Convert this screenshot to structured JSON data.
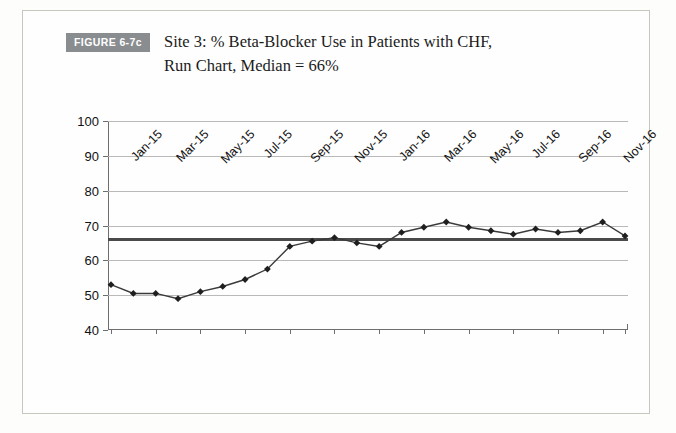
{
  "figure": {
    "badge_label": "FIGURE 6-7c",
    "caption": "Site 3: % Beta-Blocker Use in Patients with CHF,\nRun Chart, Median = 66%"
  },
  "chart_data": {
    "type": "line",
    "title": "Site 3: % Beta-Blocker Use in Patients with CHF, Run Chart, Median = 66%",
    "xlabel": "",
    "ylabel": "",
    "ylim": [
      40,
      100
    ],
    "ytick_labels": [
      "100",
      "90",
      "80",
      "70",
      "60",
      "50",
      "40"
    ],
    "ytick_values": [
      100,
      90,
      80,
      70,
      60,
      50,
      40
    ],
    "grid": true,
    "legend": "none",
    "median": 66,
    "median_label": "Median = 66%",
    "x": [
      "Jan-15",
      "Feb-15",
      "Mar-15",
      "Apr-15",
      "May-15",
      "Jun-15",
      "Jul-15",
      "Aug-15",
      "Sep-15",
      "Oct-15",
      "Nov-15",
      "Dec-15",
      "Jan-16",
      "Feb-16",
      "Mar-16",
      "Apr-16",
      "May-16",
      "Jun-16",
      "Jul-16",
      "Aug-16",
      "Sep-16",
      "Oct-16",
      "Nov-16",
      "Dec-16"
    ],
    "xtick_labels": [
      "Jan-15",
      "Mar-15",
      "May-15",
      "Jul-15",
      "Sep-15",
      "Nov-15",
      "Jan-16",
      "Mar-16",
      "May-16",
      "Jul-16",
      "Sep-16",
      "Nov-16"
    ],
    "series": [
      {
        "name": "% Beta-Blocker Use",
        "values": [
          53,
          50.5,
          50.5,
          49,
          51,
          52.5,
          54.5,
          57.5,
          64,
          65.5,
          66.5,
          65,
          64,
          68,
          69.5,
          71,
          69.5,
          68.5,
          67.5,
          69,
          68,
          68.5,
          71,
          67
        ]
      }
    ],
    "colors": {
      "line": "#3a3a3a",
      "marker": "#1f1f1f",
      "median": "#4a4a4a",
      "grid": "#b9b9b9",
      "axis": "#6e6e6e"
    }
  }
}
